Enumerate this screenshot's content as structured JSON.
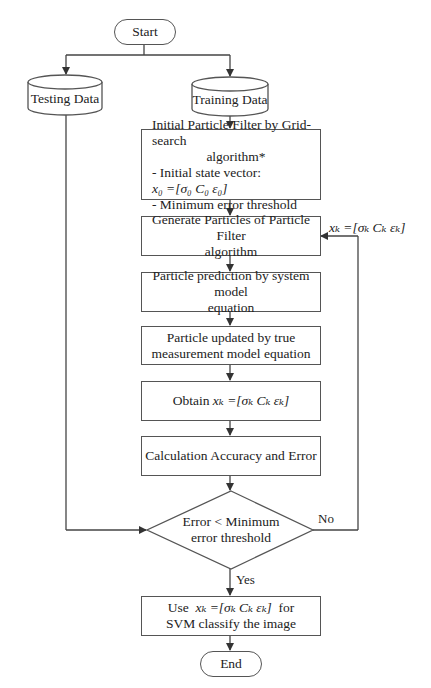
{
  "flowchart": {
    "start": "Start",
    "end": "End",
    "testing_data": "Testing Data",
    "training_data": "Training Data",
    "init_box": {
      "line1": "Initial Particle Filter by Grid-search",
      "line2": "algorithm*",
      "line3_prefix": "- Initial state vector: ",
      "line3_math": "x₀ =[σ₀ C₀ ε₀]",
      "line4": "- Minimum error threshold"
    },
    "generate_box": {
      "line1": "Generate Particles of Particle Filter",
      "line2": "algorithm"
    },
    "prediction_box": {
      "line1": "Particle prediction by system model",
      "line2": "equation"
    },
    "update_box": {
      "line1": "Particle updated by true",
      "line2": "measurement model equation"
    },
    "obtain_box": {
      "prefix": "Obtain ",
      "math": "xₖ =[σₖ Cₖ εₖ]"
    },
    "calc_box": {
      "text": "Calculation Accuracy and Error"
    },
    "decision": {
      "line1": "Error < Minimum",
      "line2": "error threshold"
    },
    "final_box": {
      "line1_prefix": "Use  ",
      "line1_math": "xₖ =[σₖ Cₖ εₖ]",
      "line1_suffix": "  for",
      "line2": "SVM classify the image"
    },
    "labels": {
      "feedback": "xₖ =[σₖ Cₖ εₖ]",
      "no": "No",
      "yes": "Yes"
    },
    "colors": {
      "stroke": "#555555",
      "text": "#222222",
      "background": "#ffffff"
    }
  }
}
